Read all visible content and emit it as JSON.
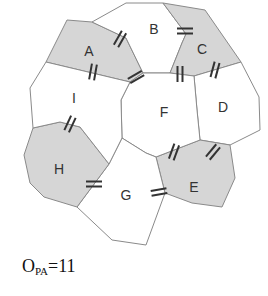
{
  "colors": {
    "shaded": "#d6d6d6",
    "unshaded": "#ffffff",
    "edge": "#8a8a8a",
    "marker": "#333333",
    "label": "#333333"
  },
  "regions": [
    {
      "id": "A",
      "label": "A",
      "shaded": true,
      "points": "67,20 92,22 126,38 143,73 130,82 46,62",
      "label_pos": [
        89,
        52
      ]
    },
    {
      "id": "B",
      "label": "B",
      "shaded": false,
      "points": "92,22 126,3 163,3 186,34 182,43 170,73 143,73 126,38",
      "label_pos": [
        154,
        30
      ]
    },
    {
      "id": "C",
      "label": "C",
      "shaded": true,
      "points": "163,3 205,10 241,62 194,76 170,73 182,43 186,34",
      "label_pos": [
        202,
        50
      ]
    },
    {
      "id": "D",
      "label": "D",
      "shaded": false,
      "points": "194,76 241,62 259,97 260,130 230,145 200,140 197,110",
      "label_pos": [
        223,
        108
      ]
    },
    {
      "id": "E",
      "label": "E",
      "shaded": true,
      "points": "156,157 200,140 230,145 235,178 222,207 192,203 165,193",
      "label_pos": [
        194,
        188
      ]
    },
    {
      "id": "F",
      "label": "F",
      "shaded": false,
      "points": "130,82 143,73 170,73 194,76 197,110 200,140 156,157 146,153 122,138 121,100",
      "label_pos": [
        164,
        113
      ]
    },
    {
      "id": "G",
      "label": "G",
      "shaded": false,
      "points": "77,207 109,164 122,138 146,153 156,157 165,193 146,245 112,240",
      "label_pos": [
        126,
        196
      ]
    },
    {
      "id": "H",
      "label": "H",
      "shaded": true,
      "points": "33,128 60,122 80,127 109,164 77,207 44,197 30,183 24,155",
      "label_pos": [
        59,
        170
      ]
    },
    {
      "id": "I",
      "label": "I",
      "shaded": false,
      "points": "46,62 130,82 121,100 122,138 109,164 80,127 60,122 33,128 30,88",
      "label_pos": [
        74,
        99
      ]
    }
  ],
  "markers": [
    {
      "between": "A-B",
      "x": 120,
      "y": 39,
      "angle": 120
    },
    {
      "between": "A-I",
      "x": 93,
      "y": 72,
      "angle": 100
    },
    {
      "between": "A-F",
      "x": 136,
      "y": 77,
      "angle": 150
    },
    {
      "between": "B-C",
      "x": 185,
      "y": 31,
      "angle": 0
    },
    {
      "between": "C-F",
      "x": 180,
      "y": 74,
      "angle": 90
    },
    {
      "between": "C-D",
      "x": 215,
      "y": 70,
      "angle": 105
    },
    {
      "between": "I-H",
      "x": 70,
      "y": 124,
      "angle": 115
    },
    {
      "between": "H-G",
      "x": 94,
      "y": 184,
      "angle": 0
    },
    {
      "between": "F-E",
      "x": 174,
      "y": 152,
      "angle": 110
    },
    {
      "between": "D-E",
      "x": 213,
      "y": 152,
      "angle": 130
    },
    {
      "between": "G-E",
      "x": 159,
      "y": 192,
      "angle": 170
    }
  ],
  "caption": {
    "main": "O",
    "subscript": "PA",
    "equals": "=11"
  }
}
